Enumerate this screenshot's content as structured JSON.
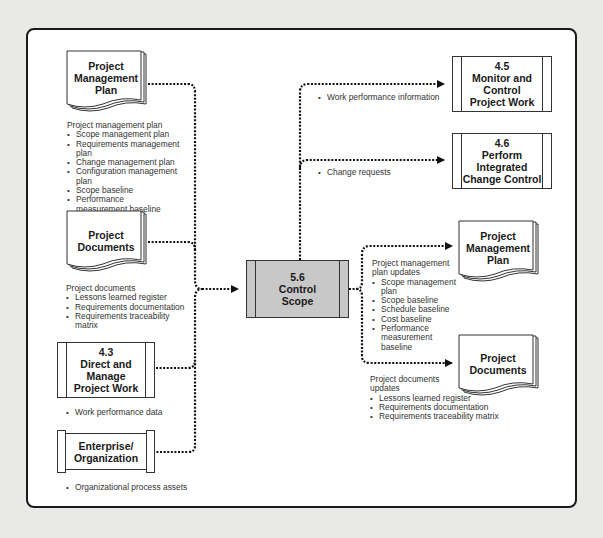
{
  "diagram": {
    "center_process": {
      "number": "5.6",
      "line1": "Control",
      "line2": "Scope"
    },
    "inputs": [
      {
        "source": {
          "line1": "Project",
          "line2": "Management",
          "line3": "Plan"
        },
        "list_heading": "Project management plan",
        "items": [
          "Scope management plan",
          "Requirements management plan",
          "Change management plan",
          "Configuration management plan",
          "Scope baseline",
          "Performance measurement baseline"
        ]
      },
      {
        "source": {
          "line1": "Project",
          "line2": "Documents"
        },
        "list_heading": "Project documents",
        "items": [
          "Lessons learned register",
          "Requirements documentation",
          "Requirements traceability matrix"
        ]
      },
      {
        "source": {
          "number": "4.3",
          "line1": "Direct and",
          "line2": "Manage",
          "line3": "Project Work"
        },
        "items": [
          "Work performance data"
        ]
      },
      {
        "source": {
          "line1": "Enterprise/",
          "line2": "Organization"
        },
        "items": [
          "Organizational process assets"
        ]
      }
    ],
    "outputs": [
      {
        "target": {
          "number": "4.5",
          "line1": "Monitor and",
          "line2": "Control",
          "line3": "Project Work"
        },
        "items": [
          "Work performance information"
        ]
      },
      {
        "target": {
          "number": "4.6",
          "line1": "Perform",
          "line2": "Integrated",
          "line3": "Change Control"
        },
        "items": [
          "Change requests"
        ]
      },
      {
        "target": {
          "line1": "Project",
          "line2": "Management",
          "line3": "Plan"
        },
        "list_heading_1": "Project management",
        "list_heading_2": "plan updates",
        "items": [
          "Scope management plan",
          "Scope baseline",
          "Schedule baseline",
          "Cost baseline",
          "Performance",
          "measurement",
          "baseline"
        ]
      },
      {
        "target": {
          "line1": "Project",
          "line2": "Documents"
        },
        "list_heading_1": "Project documents",
        "list_heading_2": "updates",
        "items": [
          "Lessons learned register",
          "Requirements documentation",
          "Requirements traceability matrix"
        ]
      }
    ],
    "colors": {
      "background": "#e9e9e7",
      "frame": "#ffffff",
      "center_fill": "#c8c8c8",
      "line": "#1a1a1a"
    }
  }
}
